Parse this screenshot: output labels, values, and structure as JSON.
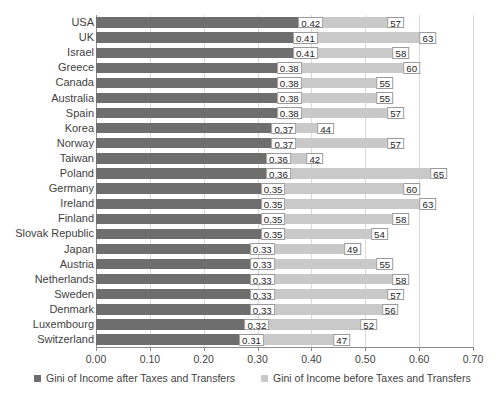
{
  "chart_data": {
    "type": "bar",
    "orientation": "horizontal",
    "title": "",
    "subtitle": "",
    "xlabel": "",
    "ylabel": "",
    "xlim": [
      0.0,
      0.7
    ],
    "xticks": [
      "0.00",
      "0.10",
      "0.20",
      "0.30",
      "0.40",
      "0.50",
      "0.60",
      "0.70"
    ],
    "xtick_values": [
      0.0,
      0.1,
      0.2,
      0.3,
      0.4,
      0.5,
      0.6,
      0.7
    ],
    "grid": true,
    "legend_position": "bottom",
    "categories": [
      "USA",
      "UK",
      "Israel",
      "Greece",
      "Canada",
      "Australia",
      "Spain",
      "Korea",
      "Norway",
      "Taiwan",
      "Poland",
      "Germany",
      "Ireland",
      "Finland",
      "Slovak Republic",
      "Japan",
      "Austria",
      "Netherlands",
      "Sweden",
      "Denmark",
      "Luxembourg",
      "Switzerland"
    ],
    "series": [
      {
        "name": "Gini of Income after Taxes and Transfers",
        "color": "#6e6e6e",
        "values": [
          0.42,
          0.41,
          0.41,
          0.38,
          0.38,
          0.38,
          0.38,
          0.37,
          0.37,
          0.36,
          0.36,
          0.35,
          0.35,
          0.35,
          0.35,
          0.33,
          0.33,
          0.33,
          0.33,
          0.33,
          0.32,
          0.31
        ],
        "labels": [
          "0.42",
          "0.41",
          "0.41",
          "0.38",
          "0.38",
          "0.38",
          "0.38",
          "0.37",
          "0.37",
          "0.36",
          "0.36",
          "0.35",
          "0.35",
          "0.35",
          "0.35",
          "0.33",
          "0.33",
          "0.33",
          "0.33",
          "0.33",
          "0.32",
          "0.31"
        ]
      },
      {
        "name": "Gini of Income before Taxes and Transfers",
        "color": "#c9c9c9",
        "values": [
          0.57,
          0.63,
          0.58,
          0.6,
          0.55,
          0.55,
          0.57,
          0.44,
          0.57,
          0.42,
          0.65,
          0.6,
          0.63,
          0.58,
          0.54,
          0.49,
          0.55,
          0.58,
          0.57,
          0.56,
          0.52,
          0.47
        ],
        "labels": [
          "57",
          "63",
          "58",
          "60",
          "55",
          "55",
          "57",
          "44",
          "57",
          "42",
          "65",
          "60",
          "63",
          "58",
          "54",
          "49",
          "55",
          "58",
          "57",
          "56",
          "52",
          "47"
        ]
      }
    ]
  },
  "legend": {
    "items": [
      {
        "label": "Gini of Income after Taxes and Transfers",
        "color": "#6e6e6e"
      },
      {
        "label": "Gini of Income before Taxes and Transfers",
        "color": "#c9c9c9"
      }
    ]
  }
}
